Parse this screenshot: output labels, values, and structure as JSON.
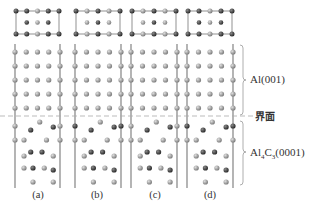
{
  "figure": {
    "panels": [
      {
        "id": "a",
        "label": "(a)",
        "x_left": 15,
        "x_right": 60
      },
      {
        "id": "b",
        "label": "(b)",
        "x_left": 75,
        "x_right": 121
      },
      {
        "id": "c",
        "label": "(c)",
        "x_left": 131,
        "x_right": 177
      },
      {
        "id": "d",
        "label": "(d)",
        "x_left": 187,
        "x_right": 233
      }
    ],
    "regions": {
      "top": {
        "label": "Al(001)"
      },
      "interface": {
        "label": "界面"
      },
      "bottom": {
        "label_main": "Al",
        "label_sub1": "4",
        "label_mid": "C",
        "label_sub2": "3",
        "label_tail": "(0001)"
      }
    },
    "colors": {
      "line": "#777777",
      "al_atom": "#9a9a9a",
      "c_atom": "#3a3a3a",
      "dashed": "#aaaaaa",
      "text": "#333333"
    }
  }
}
